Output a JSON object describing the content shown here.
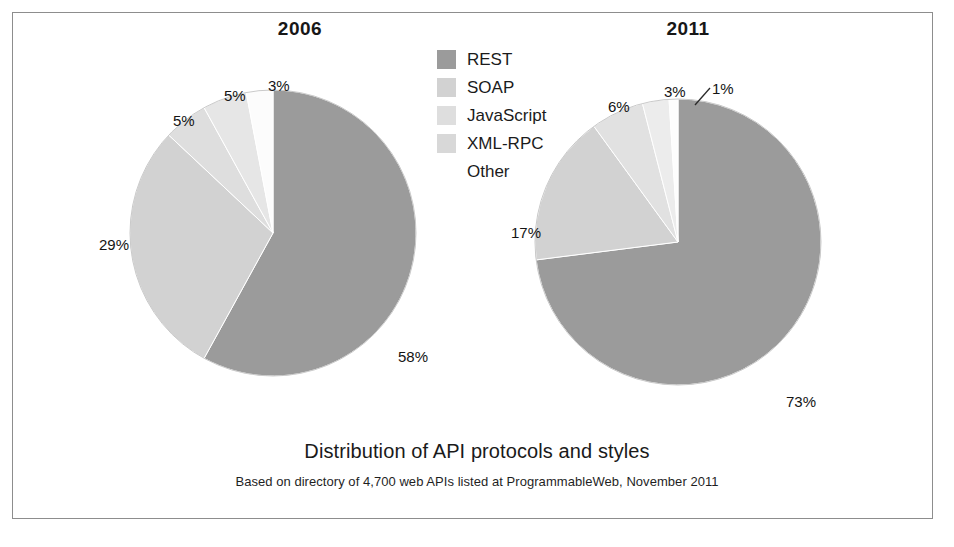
{
  "frame": {
    "border_color": "#8d8d8d"
  },
  "legend": {
    "items": [
      {
        "label": "REST",
        "color": "#9b9b9b"
      },
      {
        "label": "SOAP",
        "color": "#d2d2d2"
      },
      {
        "label": "JavaScript",
        "color": "#dedede"
      },
      {
        "label": "XML-RPC",
        "color": "#d8d8d8"
      },
      {
        "label": "Other",
        "color": "#ffffff"
      }
    ]
  },
  "caption": {
    "title": "Distribution of API protocols and styles",
    "subtitle": "Based on directory of 4,700 web APIs listed at ProgrammableWeb, November 2011"
  },
  "chart_data": [
    {
      "type": "pie",
      "title": "2006",
      "labels": [
        "REST",
        "SOAP",
        "JavaScript",
        "XML-RPC",
        "Other"
      ],
      "values": [
        58,
        29,
        5,
        5,
        3
      ],
      "value_labels": [
        "58%",
        "29%",
        "5%",
        "5%",
        "3%"
      ],
      "colors": [
        "#9b9b9b",
        "#d2d2d2",
        "#dedede",
        "#e6e6e6",
        "#fcfcfc"
      ],
      "units": "percent",
      "start_angle_deg": 0,
      "direction": "clockwise",
      "legend_position": "center-top",
      "grid": false
    },
    {
      "type": "pie",
      "title": "2011",
      "labels": [
        "REST",
        "SOAP",
        "JavaScript",
        "XML-RPC",
        "Other"
      ],
      "values": [
        73,
        17,
        6,
        3,
        1
      ],
      "value_labels": [
        "73%",
        "17%",
        "6%",
        "3%",
        "1%"
      ],
      "colors": [
        "#9b9b9b",
        "#d2d2d2",
        "#e1e1e1",
        "#ececec",
        "#fdfdfd"
      ],
      "units": "percent",
      "start_angle_deg": 0,
      "direction": "clockwise",
      "legend_position": "center-top",
      "grid": false
    }
  ]
}
